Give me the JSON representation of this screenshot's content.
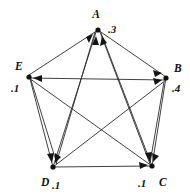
{
  "figure": {
    "type": "directed-graph",
    "background_color": "#ffffff",
    "edge_color": "#2b2b2b",
    "node_color": "#111111",
    "text_color": "#121212"
  },
  "nodes": [
    {
      "id": "A",
      "label": "A",
      "weight": ".3",
      "x": 98,
      "y": 30,
      "label_x": 96,
      "label_y": 18,
      "weight_x": 108,
      "weight_y": 32
    },
    {
      "id": "B",
      "label": "B",
      "weight": ".4",
      "x": 166,
      "y": 77,
      "label_x": 174,
      "label_y": 72,
      "weight_x": 173,
      "weight_y": 91
    },
    {
      "id": "C",
      "label": "C",
      "weight": ".1",
      "x": 152,
      "y": 166,
      "label_x": 159,
      "label_y": 184,
      "weight_x": 140,
      "weight_y": 184
    },
    {
      "id": "D",
      "label": "D",
      "weight": ".1",
      "x": 53,
      "y": 167,
      "label_x": 41,
      "label_y": 185,
      "weight_x": 55,
      "weight_y": 187
    },
    {
      "id": "E",
      "label": "E",
      "weight": ".1",
      "x": 29,
      "y": 75,
      "label_x": 15,
      "label_y": 69,
      "weight_x": 12,
      "weight_y": 90
    }
  ],
  "edges": [
    {
      "from": "E",
      "to": "A",
      "kind": "perimeter"
    },
    {
      "from": "A",
      "to": "B",
      "kind": "perimeter"
    },
    {
      "from": "B",
      "to": "C",
      "kind": "perimeter"
    },
    {
      "from": "C",
      "to": "D",
      "kind": "perimeter"
    },
    {
      "from": "D",
      "to": "E",
      "kind": "perimeter"
    },
    {
      "from": "B",
      "to": "E",
      "kind": "perimeter"
    },
    {
      "from": "D",
      "to": "A",
      "kind": "diagonal"
    },
    {
      "from": "C",
      "to": "A",
      "kind": "diagonal"
    },
    {
      "from": "E",
      "to": "C",
      "kind": "diagonal"
    },
    {
      "from": "D",
      "to": "B",
      "kind": "diagonal"
    },
    {
      "from": "A",
      "to": "C",
      "kind": "diagonal"
    },
    {
      "from": "A",
      "to": "D",
      "kind": "diagonal"
    },
    {
      "from": "E",
      "to": "D",
      "kind": "diagonal"
    },
    {
      "from": "B",
      "to": "C",
      "kind": "diagonal"
    }
  ]
}
